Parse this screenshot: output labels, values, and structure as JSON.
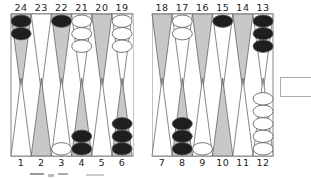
{
  "board": {
    "colors": {
      "frame": "#888888",
      "dark_point": "#c8c8c8",
      "light_point": "#ffffff",
      "point_stroke": "#555555",
      "black_checker": "#1e1e1e",
      "white_checker": "#ffffff",
      "checker_stroke": "#555555"
    },
    "top_labels": [
      "24",
      "23",
      "22",
      "21",
      "20",
      "19",
      "18",
      "17",
      "16",
      "15",
      "14",
      "13"
    ],
    "bottom_labels": [
      "1",
      "2",
      "3",
      "4",
      "5",
      "6",
      "7",
      "8",
      "9",
      "10",
      "11",
      "12"
    ],
    "top_points": [
      {
        "point": 24,
        "shade": "dark",
        "checkers": {
          "color": "black",
          "count": 2
        }
      },
      {
        "point": 23,
        "shade": "light",
        "checkers": {
          "color": "none",
          "count": 0
        }
      },
      {
        "point": 22,
        "shade": "dark",
        "checkers": {
          "color": "black",
          "count": 1
        }
      },
      {
        "point": 21,
        "shade": "light",
        "checkers": {
          "color": "white",
          "count": 3
        }
      },
      {
        "point": 20,
        "shade": "dark",
        "checkers": {
          "color": "none",
          "count": 0
        }
      },
      {
        "point": 19,
        "shade": "light",
        "checkers": {
          "color": "white",
          "count": 3
        }
      },
      {
        "point": 18,
        "shade": "dark",
        "checkers": {
          "color": "none",
          "count": 0
        }
      },
      {
        "point": 17,
        "shade": "light",
        "checkers": {
          "color": "white",
          "count": 2
        }
      },
      {
        "point": 16,
        "shade": "dark",
        "checkers": {
          "color": "none",
          "count": 0
        }
      },
      {
        "point": 15,
        "shade": "light",
        "checkers": {
          "color": "black",
          "count": 1
        }
      },
      {
        "point": 14,
        "shade": "dark",
        "checkers": {
          "color": "none",
          "count": 0
        }
      },
      {
        "point": 13,
        "shade": "light",
        "checkers": {
          "color": "black",
          "count": 3
        }
      }
    ],
    "bottom_points": [
      {
        "point": 1,
        "shade": "light",
        "checkers": {
          "color": "none",
          "count": 0
        }
      },
      {
        "point": 2,
        "shade": "dark",
        "checkers": {
          "color": "none",
          "count": 0
        }
      },
      {
        "point": 3,
        "shade": "light",
        "checkers": {
          "color": "white",
          "count": 1
        }
      },
      {
        "point": 4,
        "shade": "dark",
        "checkers": {
          "color": "black",
          "count": 2
        }
      },
      {
        "point": 5,
        "shade": "light",
        "checkers": {
          "color": "none",
          "count": 0
        }
      },
      {
        "point": 6,
        "shade": "dark",
        "checkers": {
          "color": "black",
          "count": 3
        }
      },
      {
        "point": 7,
        "shade": "light",
        "checkers": {
          "color": "none",
          "count": 0
        }
      },
      {
        "point": 8,
        "shade": "dark",
        "checkers": {
          "color": "black",
          "count": 3
        }
      },
      {
        "point": 9,
        "shade": "light",
        "checkers": {
          "color": "white",
          "count": 1
        }
      },
      {
        "point": 10,
        "shade": "dark",
        "checkers": {
          "color": "none",
          "count": 0
        }
      },
      {
        "point": 11,
        "shade": "light",
        "checkers": {
          "color": "none",
          "count": 0
        }
      },
      {
        "point": 12,
        "shade": "light",
        "checkers": {
          "color": "white",
          "count": 5
        }
      }
    ]
  }
}
